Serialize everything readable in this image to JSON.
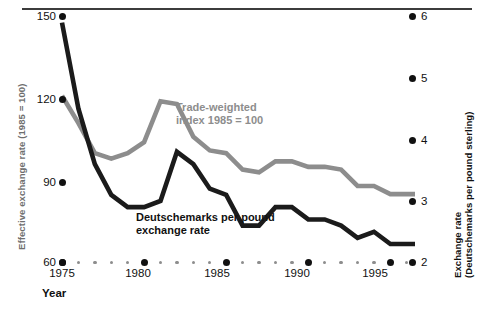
{
  "chart_data": {
    "type": "line",
    "title": "",
    "xlabel": "Year",
    "x_ticks": [
      1975,
      1980,
      1985,
      1990,
      1995
    ],
    "xlim": [
      1975,
      1996.5
    ],
    "grid": false,
    "legend": "inline-annotations",
    "axes": [
      {
        "id": "left",
        "label": "Effective exchange rate (1985 = 100)",
        "ticks": [
          150,
          120,
          90,
          60
        ],
        "lim": [
          60,
          150
        ],
        "color": "#8d8d8d"
      },
      {
        "id": "right",
        "label_line1": "Exchange rate",
        "label_line2": "(Deutschemarks per pound sterling)",
        "ticks": [
          6,
          5,
          4,
          3,
          2
        ],
        "lim": [
          2,
          6
        ],
        "color": "#111111"
      }
    ],
    "x": [
      1975,
      1976,
      1977,
      1978,
      1979,
      1980,
      1981,
      1982,
      1983,
      1984,
      1985,
      1986,
      1987,
      1988,
      1989,
      1990,
      1991,
      1992,
      1993,
      1994,
      1995,
      1996.5
    ],
    "series": [
      {
        "name": "Trade-weighted index 1985 = 100",
        "axis": "left",
        "color": "#8d8d8d",
        "label_line1": "Trade-weighted",
        "label_line2": "index 1985 = 100",
        "values": [
          121,
          111,
          100,
          98,
          100,
          104,
          119,
          118,
          106,
          101,
          100,
          94,
          93,
          97,
          97,
          95,
          95,
          94,
          88,
          88,
          85,
          85
        ]
      },
      {
        "name": "Deutschemarks per pound exchange rate",
        "axis": "right",
        "color": "#1b1b1b",
        "label_line1": "Deutschemarks per pound",
        "label_line2": "exchange rate",
        "values": [
          5.9,
          4.5,
          3.6,
          3.1,
          2.9,
          2.9,
          3.0,
          3.8,
          3.6,
          3.2,
          3.1,
          2.6,
          2.6,
          2.9,
          2.9,
          2.7,
          2.7,
          2.6,
          2.4,
          2.5,
          2.3,
          2.3
        ]
      }
    ]
  },
  "left_axis": {
    "title": "Effective exchange rate (1985 = 100)",
    "ticks": [
      "150",
      "120",
      "90",
      "60"
    ]
  },
  "right_axis": {
    "title_line1": "Exchange rate",
    "title_line2": "(Deutschemarks per pound sterling)",
    "ticks": [
      "6",
      "5",
      "4",
      "3",
      "2"
    ]
  },
  "x_axis": {
    "title": "Year",
    "ticks": [
      "1975",
      "1980",
      "1985",
      "1990",
      "1995"
    ]
  },
  "annotations": {
    "trade_weighted_line1": "Trade-weighted",
    "trade_weighted_line2": "index 1985 = 100",
    "deutschemark_line1": "Deutschemarks per pound",
    "deutschemark_line2": "exchange rate"
  },
  "colors": {
    "grey_series": "#8d8d8d",
    "black_series": "#1b1b1b",
    "rule": "#3c3c3c",
    "background": "#ffffff"
  }
}
